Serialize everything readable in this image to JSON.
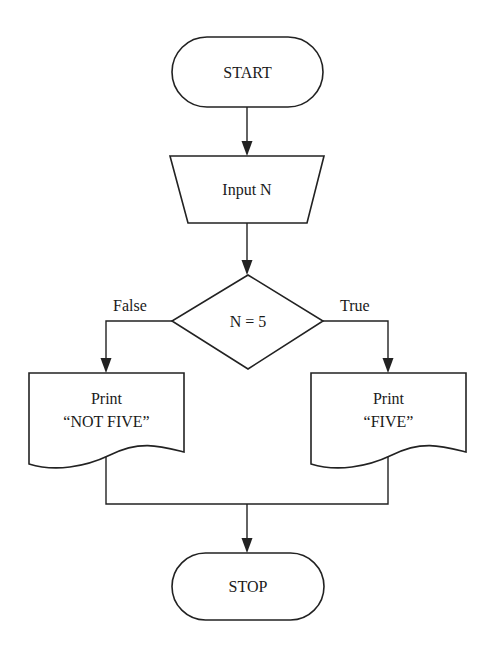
{
  "diagram": {
    "type": "flowchart",
    "nodes": {
      "start": {
        "shape": "terminator",
        "label": "START"
      },
      "input": {
        "shape": "manual-input",
        "label": "Input N"
      },
      "decision": {
        "shape": "decision",
        "label": "N = 5"
      },
      "print_not_five": {
        "shape": "document",
        "line1": "Print",
        "line2": "“NOT FIVE”"
      },
      "print_five": {
        "shape": "document",
        "line1": "Print",
        "line2": "“FIVE”"
      },
      "stop": {
        "shape": "terminator",
        "label": "STOP"
      }
    },
    "branches": {
      "false_label": "False",
      "true_label": "True"
    },
    "edges": [
      {
        "from": "start",
        "to": "input"
      },
      {
        "from": "input",
        "to": "decision"
      },
      {
        "from": "decision",
        "to": "print_not_five",
        "label": "False"
      },
      {
        "from": "decision",
        "to": "print_five",
        "label": "True"
      },
      {
        "from": "print_not_five",
        "to": "stop"
      },
      {
        "from": "print_five",
        "to": "stop"
      }
    ],
    "colors": {
      "stroke": "#222222",
      "fill": "#ffffff",
      "text": "#1a1a1a"
    }
  }
}
